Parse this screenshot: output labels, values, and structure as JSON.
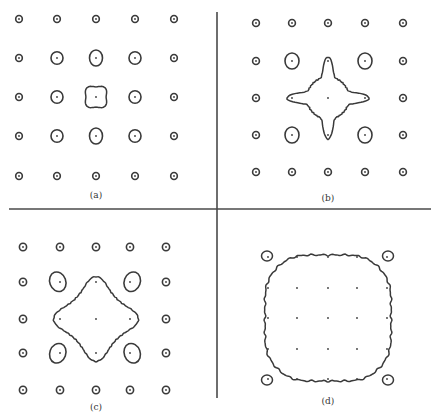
{
  "figure": {
    "ink_color": "#3a3a3a",
    "divider_color": "#4a4a4a",
    "panels": [
      {
        "id": "a",
        "label": "(a)",
        "label_pos": [
          96,
          196
        ],
        "cols": [
          19,
          57,
          96,
          135,
          174
        ],
        "rows": [
          19,
          58,
          97,
          136,
          176
        ],
        "state": "isolated-loops-center-largest"
      },
      {
        "id": "b",
        "label": "(b)",
        "label_pos": [
          328,
          199
        ],
        "cols": [
          256,
          292,
          328,
          365,
          403
        ],
        "rows": [
          23,
          61,
          98,
          135,
          172
        ],
        "state": "center-merged-with-four-neighbors"
      },
      {
        "id": "c",
        "label": "(c)",
        "label_pos": [
          96,
          408
        ],
        "cols": [
          23,
          60,
          96,
          130,
          166
        ],
        "rows": [
          247,
          282,
          319,
          353,
          390
        ],
        "state": "inner-3x3-cross-merged-diagonal-lobes"
      },
      {
        "id": "d",
        "label": "(d)",
        "label_pos": [
          328,
          402
        ],
        "cols": [
          268,
          297,
          328,
          357,
          387
        ],
        "rows": [
          257,
          288,
          318,
          349,
          379
        ],
        "state": "single-contour-with-corner-lobes"
      }
    ],
    "dividers": {
      "vertical": {
        "x": 217,
        "y1": 12,
        "y2": 398
      },
      "horizontal": {
        "y": 209,
        "x1": 9,
        "x2": 431
      }
    }
  }
}
